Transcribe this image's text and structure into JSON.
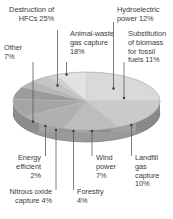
{
  "figure": {
    "background_color": "#ffffff",
    "text_color": "#3c3c3c",
    "leader_line_color": "#5a5a5a"
  },
  "chart_data": {
    "type": "pie",
    "title": "",
    "subtitle": "",
    "xlabel": "",
    "ylabel": "",
    "grid": false,
    "legend_position": "callout-labels",
    "three_d": true,
    "units": "%",
    "total": 100,
    "categories": [
      "Destruction of HFCs",
      "Animal-waste gas capture",
      "Hydroelectric power",
      "Substitution of biomass for fossil fuels",
      "Landfill gas capture",
      "Wind power",
      "Forestry",
      "Nitrous oxide capture",
      "Energy efficient",
      "Other"
    ],
    "values": [
      25,
      18,
      12,
      11,
      10,
      7,
      4,
      4,
      2,
      7
    ],
    "slice_colors": [
      "#d9d9d9",
      "#cacaca",
      "#bdbdbd",
      "#b0b0b0",
      "#a5a5a5",
      "#9b9b9b",
      "#b7b7b7",
      "#c4c4c4",
      "#d0d0d0",
      "#e2e2e2"
    ],
    "side_colors": [
      "#9e9e9e",
      "#949494",
      "#8c8c8c",
      "#848484",
      "#7d7d7d"
    ]
  },
  "labels": {
    "destruction_hfcs": "Destruction of\nHFCs 25%",
    "animal_waste": "Animal-waste\ngas capture\n18%",
    "hydroelectric": "Hydroelectric\npower 12%",
    "substitution": "Substitution\nof biomass\nfor fossil\nfuels 11%",
    "other": "Other\n7%",
    "landfill": "Landfill\ngas\ncapture\n10%",
    "wind": "Wind\npower\n7%",
    "forestry": "Forestry\n4%",
    "nitrous": "Nitrous oxide\ncapture 4%",
    "energy_efficient": "Energy\nefficient\n2%"
  }
}
